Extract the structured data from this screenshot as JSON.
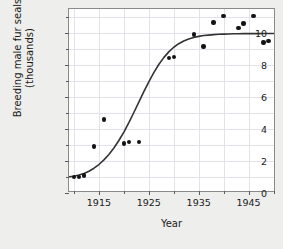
{
  "chart_data": {
    "type": "scatter",
    "title": "",
    "xlabel": "Year",
    "ylabel_line1": "Breeding male fur seals",
    "ylabel_line2": "(thousands)",
    "xlim": [
      1909,
      1950.5
    ],
    "ylim": [
      0,
      11.5
    ],
    "grid": true,
    "legend": "none",
    "xticks": [
      1915,
      1925,
      1935,
      1945
    ],
    "xtick_labels": [
      "1915",
      "1925",
      "1935",
      "1945"
    ],
    "xminor_ticks": [
      1910,
      1920,
      1930,
      1940,
      1950
    ],
    "yticks": [
      0,
      2,
      4,
      6,
      8,
      10
    ],
    "ytick_labels": [
      "0",
      "2",
      "4",
      "6",
      "8",
      "10"
    ],
    "yminor_ticks": [
      1,
      3,
      5,
      7,
      9,
      11
    ],
    "point_color": "#141414",
    "curve_color": "#333333",
    "grid_color": "#e2e2ea",
    "frame_color": "#8a8a8a",
    "background_color": "#eeeeec",
    "plot_background_color": "#ffffff",
    "x": [
      1910,
      1911,
      1912,
      1914,
      1916,
      1920,
      1921,
      1923,
      1929,
      1930,
      1934,
      1936,
      1938,
      1940,
      1943,
      1944,
      1946,
      1948,
      1949
    ],
    "y": [
      1.0,
      1.0,
      1.1,
      2.9,
      4.6,
      3.1,
      3.2,
      3.2,
      8.45,
      8.5,
      9.9,
      9.15,
      10.65,
      11.05,
      10.3,
      10.6,
      11.05,
      9.4,
      9.5
    ],
    "points": [
      {
        "x": 1910,
        "y": 1.0
      },
      {
        "x": 1911,
        "y": 1.0
      },
      {
        "x": 1912,
        "y": 1.1
      },
      {
        "x": 1914,
        "y": 2.9
      },
      {
        "x": 1916,
        "y": 4.6
      },
      {
        "x": 1920,
        "y": 3.1
      },
      {
        "x": 1921,
        "y": 3.2
      },
      {
        "x": 1923,
        "y": 3.2
      },
      {
        "x": 1929,
        "y": 8.45
      },
      {
        "x": 1930,
        "y": 8.5
      },
      {
        "x": 1934,
        "y": 9.9
      },
      {
        "x": 1936,
        "y": 9.15
      },
      {
        "x": 1938,
        "y": 10.65
      },
      {
        "x": 1940,
        "y": 11.05
      },
      {
        "x": 1943,
        "y": 10.3
      },
      {
        "x": 1944,
        "y": 10.6
      },
      {
        "x": 1946,
        "y": 11.05
      },
      {
        "x": 1948,
        "y": 9.4
      },
      {
        "x": 1949,
        "y": 9.5
      }
    ],
    "fitted_curve": {
      "name": "logistic-fit",
      "description": "Logistic growth curve fitted through the scatter",
      "x": [
        1909,
        1910,
        1911,
        1912,
        1913,
        1914,
        1915,
        1916,
        1917,
        1918,
        1919,
        1920,
        1921,
        1922,
        1923,
        1924,
        1925,
        1926,
        1927,
        1928,
        1929,
        1930,
        1931,
        1932,
        1933,
        1934,
        1935,
        1936,
        1937,
        1938,
        1939,
        1940,
        1941,
        1942,
        1943,
        1944,
        1945,
        1946,
        1947,
        1948,
        1949,
        1950
      ],
      "y": [
        1.02,
        1.05,
        1.12,
        1.22,
        1.36,
        1.55,
        1.78,
        2.07,
        2.41,
        2.81,
        3.28,
        3.81,
        4.4,
        5.03,
        5.68,
        6.33,
        6.95,
        7.52,
        8.03,
        8.46,
        8.82,
        9.11,
        9.33,
        9.5,
        9.63,
        9.72,
        9.79,
        9.84,
        9.87,
        9.9,
        9.92,
        9.93,
        9.94,
        9.95,
        9.95,
        9.96,
        9.96,
        9.96,
        9.96,
        9.97,
        9.97,
        9.97
      ]
    }
  }
}
